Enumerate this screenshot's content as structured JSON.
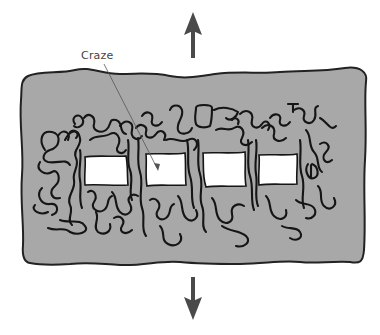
{
  "diagram": {
    "type": "schematic illustration",
    "labels": {
      "craze": "Craze"
    },
    "arrows": [
      {
        "name": "tensile-stress-up",
        "direction": "up"
      },
      {
        "name": "tensile-stress-down",
        "direction": "down"
      }
    ],
    "voids_count": 4,
    "colors": {
      "background": "#ffffff",
      "polymer_body": "#a8a8a8",
      "outline": "#222222",
      "fibrils": "#151515",
      "voids": "#ffffff",
      "arrows": "#4a4a4a",
      "label_text": "#444444",
      "leader_line": "#555555"
    }
  }
}
